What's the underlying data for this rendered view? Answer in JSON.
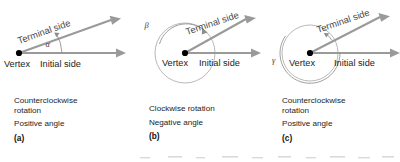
{
  "figure": {
    "background_color": "#ffffff",
    "ray_color": "#9a9a9a",
    "arc_color": "#8e8e8e",
    "vertex_color": "#000000",
    "text_color": "#1c1c1c"
  },
  "panels": [
    {
      "id": "a",
      "label": "(a)",
      "angle_symbol": "α",
      "vertex_label": "Vertex",
      "initial_side_label": "Initial side",
      "terminal_side_label": "Terminal side",
      "caption_lines": [
        "Counterclockwise",
        "rotation",
        "Positive angle"
      ],
      "rotation_direction": "counterclockwise",
      "angle_sign": "positive",
      "approx_angle_degrees": 30,
      "has_circle": false
    },
    {
      "id": "b",
      "label": "(b)",
      "angle_symbol": "β",
      "vertex_label": "Vertex",
      "initial_side_label": "Initial side",
      "terminal_side_label": "Terminal side",
      "caption_lines": [
        "Clockwise rotation",
        "Negative angle"
      ],
      "rotation_direction": "clockwise",
      "angle_sign": "negative",
      "approx_angle_degrees": -330,
      "has_circle": true
    },
    {
      "id": "c",
      "label": "(c)",
      "angle_symbol": "γ",
      "vertex_label": "Vertex",
      "initial_side_label": "Initial side",
      "terminal_side_label": "Terminal side",
      "caption_lines": [
        "Counterclockwise",
        "rotation",
        "Positive angle"
      ],
      "rotation_direction": "counterclockwise",
      "angle_sign": "positive",
      "approx_angle_degrees": 390,
      "has_circle": true
    }
  ]
}
